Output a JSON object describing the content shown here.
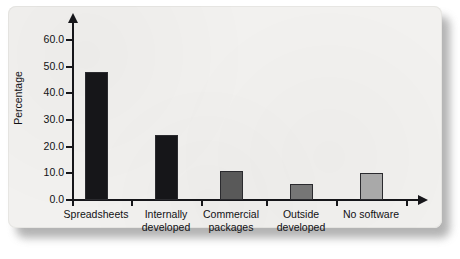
{
  "chart_data": {
    "type": "bar",
    "title": "",
    "subtitle": "",
    "xlabel": "",
    "ylabel": "Percentage",
    "categories": [
      "Spreadsheets",
      "Internally developed",
      "Commercial packages",
      "Outside developed",
      "No software"
    ],
    "category_lines": [
      [
        "Spreadsheets"
      ],
      [
        "Internally",
        "developed"
      ],
      [
        "Commercial",
        "packages"
      ],
      [
        "Outside",
        "developed"
      ],
      [
        "No software"
      ]
    ],
    "values": [
      48,
      24.5,
      11,
      6,
      10
    ],
    "bar_colors": [
      "#161619",
      "#161619",
      "#595959",
      "#767676",
      "#a9a9a9"
    ],
    "ylim": [
      0,
      60
    ],
    "ytick_values": [
      0,
      10,
      20,
      30,
      40,
      50,
      60
    ],
    "ytick_labels": [
      "0.0",
      "10.0",
      "20.0",
      "30.0",
      "40.0",
      "50.0",
      "60.0"
    ],
    "grid": false,
    "legend": null,
    "axis_arrows": true
  },
  "figure": {
    "background_color": "#f2f1ef",
    "axis_color": "#16161a",
    "text_color": "#111114"
  }
}
